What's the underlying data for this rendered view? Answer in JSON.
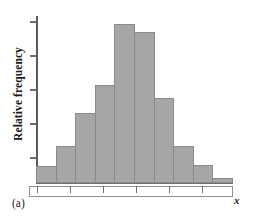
{
  "figure": {
    "panel_label": "(a)",
    "colors": {
      "bar_fill": "#a6a6a6",
      "bar_stroke": "#8a8a8a",
      "axis": "#6e6e6e",
      "text": "#1a1a1a",
      "background": "#ffffff"
    }
  },
  "chart_data": {
    "type": "bar",
    "title": "",
    "subtitle": "",
    "xlabel": "x",
    "ylabel": "Relative frequency",
    "grid": false,
    "legend": null,
    "annotations": [
      "(a)"
    ],
    "axis_tick_labels_shown": false,
    "x_tick_count": 6,
    "y_tick_count": 5,
    "xlim": [
      0,
      10
    ],
    "ylim": [
      0,
      1
    ],
    "bin_edges": [
      0,
      1,
      2,
      3,
      4,
      5,
      6,
      7,
      8,
      9,
      10
    ],
    "categories": [
      "1",
      "2",
      "3",
      "4",
      "5",
      "6",
      "7",
      "8",
      "9",
      "10"
    ],
    "values": [
      0.1,
      0.22,
      0.42,
      0.59,
      0.96,
      0.91,
      0.51,
      0.22,
      0.11,
      0.03
    ]
  }
}
